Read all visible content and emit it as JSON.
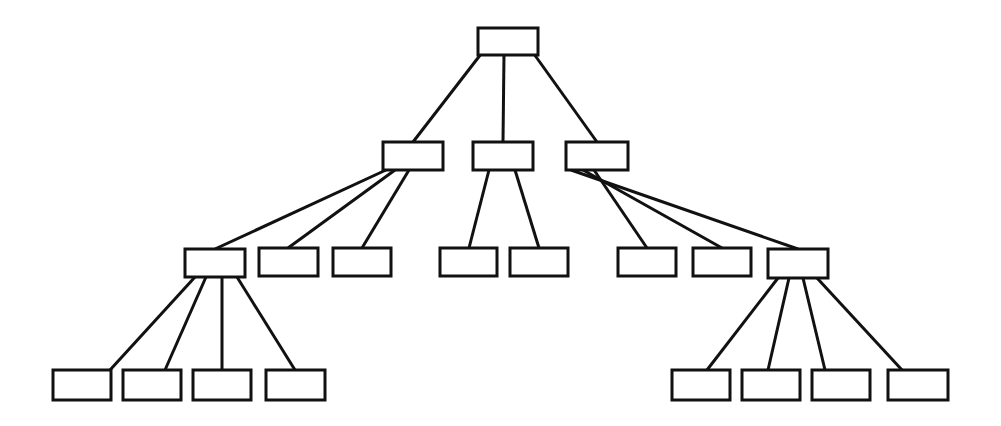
{
  "diagram": {
    "type": "tree",
    "background_color": "#ffffff",
    "stroke_color": "#111111",
    "node_fill_color": "#ffffff",
    "stroke_width": 3,
    "canvas": {
      "width": 1001,
      "height": 426
    },
    "level_count": 4,
    "node_count": 20,
    "edge_count": 19,
    "levels": [
      {
        "index": 0,
        "name": "root",
        "node_count": 1
      },
      {
        "index": 1,
        "name": "level-2",
        "node_count": 3
      },
      {
        "index": 2,
        "name": "level-3",
        "node_count": 8
      },
      {
        "index": 3,
        "name": "level-4",
        "node_count": 8
      }
    ],
    "nodes": [
      {
        "id": "n0",
        "label": "",
        "level": 0,
        "x": 478,
        "y": 28,
        "w": 60,
        "h": 27,
        "parent": null
      },
      {
        "id": "n1",
        "label": "",
        "level": 1,
        "x": 383,
        "y": 142,
        "w": 60,
        "h": 28,
        "parent": "n0"
      },
      {
        "id": "n2",
        "label": "",
        "level": 1,
        "x": 473,
        "y": 142,
        "w": 60,
        "h": 28,
        "parent": "n0"
      },
      {
        "id": "n3",
        "label": "",
        "level": 1,
        "x": 566,
        "y": 142,
        "w": 62,
        "h": 28,
        "parent": "n0"
      },
      {
        "id": "n4",
        "label": "",
        "level": 2,
        "x": 185,
        "y": 249,
        "w": 60,
        "h": 28,
        "parent": "n1"
      },
      {
        "id": "n5",
        "label": "",
        "level": 2,
        "x": 259,
        "y": 248,
        "w": 59,
        "h": 28,
        "parent": "n1"
      },
      {
        "id": "n6",
        "label": "",
        "level": 2,
        "x": 333,
        "y": 248,
        "w": 58,
        "h": 28,
        "parent": "n1"
      },
      {
        "id": "n7",
        "label": "",
        "level": 2,
        "x": 440,
        "y": 248,
        "w": 57,
        "h": 28,
        "parent": "n2"
      },
      {
        "id": "n8",
        "label": "",
        "level": 2,
        "x": 510,
        "y": 248,
        "w": 58,
        "h": 28,
        "parent": "n2"
      },
      {
        "id": "n9",
        "label": "",
        "level": 2,
        "x": 618,
        "y": 248,
        "w": 58,
        "h": 28,
        "parent": "n3"
      },
      {
        "id": "n10",
        "label": "",
        "level": 2,
        "x": 693,
        "y": 248,
        "w": 58,
        "h": 28,
        "parent": "n3"
      },
      {
        "id": "n11",
        "label": "",
        "level": 2,
        "x": 768,
        "y": 249,
        "w": 60,
        "h": 29,
        "parent": "n3"
      },
      {
        "id": "n12",
        "label": "",
        "level": 3,
        "x": 53,
        "y": 370,
        "w": 58,
        "h": 30,
        "parent": "n4"
      },
      {
        "id": "n13",
        "label": "",
        "level": 3,
        "x": 123,
        "y": 370,
        "w": 58,
        "h": 30,
        "parent": "n4"
      },
      {
        "id": "n14",
        "label": "",
        "level": 3,
        "x": 193,
        "y": 370,
        "w": 58,
        "h": 30,
        "parent": "n4"
      },
      {
        "id": "n15",
        "label": "",
        "level": 3,
        "x": 266,
        "y": 370,
        "w": 59,
        "h": 30,
        "parent": "n4"
      },
      {
        "id": "n16",
        "label": "",
        "level": 3,
        "x": 672,
        "y": 370,
        "w": 58,
        "h": 30,
        "parent": "n11"
      },
      {
        "id": "n17",
        "label": "",
        "level": 3,
        "x": 742,
        "y": 370,
        "w": 58,
        "h": 30,
        "parent": "n11"
      },
      {
        "id": "n18",
        "label": "",
        "level": 3,
        "x": 812,
        "y": 370,
        "w": 58,
        "h": 30,
        "parent": "n11"
      },
      {
        "id": "n19",
        "label": "",
        "level": 3,
        "x": 888,
        "y": 370,
        "w": 60,
        "h": 30,
        "parent": "n11"
      }
    ],
    "edges": [
      {
        "id": "e0",
        "from": "n0",
        "to": "n1",
        "x1": 481,
        "y1": 54,
        "x2": 413,
        "y2": 142
      },
      {
        "id": "e1",
        "from": "n0",
        "to": "n2",
        "x1": 504,
        "y1": 54,
        "x2": 503,
        "y2": 142
      },
      {
        "id": "e2",
        "from": "n0",
        "to": "n3",
        "x1": 534,
        "y1": 54,
        "x2": 597,
        "y2": 142
      },
      {
        "id": "e3",
        "from": "n1",
        "to": "n4",
        "x1": 386,
        "y1": 170,
        "x2": 215,
        "y2": 249
      },
      {
        "id": "e4",
        "from": "n1",
        "to": "n5",
        "x1": 395,
        "y1": 170,
        "x2": 288,
        "y2": 248
      },
      {
        "id": "e5",
        "from": "n1",
        "to": "n6",
        "x1": 409,
        "y1": 170,
        "x2": 362,
        "y2": 248
      },
      {
        "id": "e6",
        "from": "n2",
        "to": "n7",
        "x1": 489,
        "y1": 170,
        "x2": 469,
        "y2": 248
      },
      {
        "id": "e7",
        "from": "n2",
        "to": "n8",
        "x1": 515,
        "y1": 170,
        "x2": 539,
        "y2": 248
      },
      {
        "id": "e8",
        "from": "n3",
        "to": "n9",
        "x1": 594,
        "y1": 170,
        "x2": 647,
        "y2": 248
      },
      {
        "id": "e9",
        "from": "n3",
        "to": "n10",
        "x1": 583,
        "y1": 170,
        "x2": 722,
        "y2": 248
      },
      {
        "id": "e10",
        "from": "n3",
        "to": "n11",
        "x1": 571,
        "y1": 170,
        "x2": 798,
        "y2": 249
      },
      {
        "id": "e11",
        "from": "n4",
        "to": "n12",
        "x1": 195,
        "y1": 277,
        "x2": 110,
        "y2": 370
      },
      {
        "id": "e12",
        "from": "n4",
        "to": "n13",
        "x1": 206,
        "y1": 277,
        "x2": 165,
        "y2": 370
      },
      {
        "id": "e13",
        "from": "n4",
        "to": "n14",
        "x1": 222,
        "y1": 277,
        "x2": 222,
        "y2": 370
      },
      {
        "id": "e14",
        "from": "n4",
        "to": "n15",
        "x1": 237,
        "y1": 277,
        "x2": 295,
        "y2": 370
      },
      {
        "id": "e15",
        "from": "n11",
        "to": "n16",
        "x1": 778,
        "y1": 278,
        "x2": 707,
        "y2": 370
      },
      {
        "id": "e16",
        "from": "n11",
        "to": "n17",
        "x1": 789,
        "y1": 278,
        "x2": 768,
        "y2": 370
      },
      {
        "id": "e17",
        "from": "n11",
        "to": "n18",
        "x1": 803,
        "y1": 278,
        "x2": 825,
        "y2": 370
      },
      {
        "id": "e18",
        "from": "n11",
        "to": "n19",
        "x1": 817,
        "y1": 278,
        "x2": 902,
        "y2": 370
      }
    ]
  }
}
